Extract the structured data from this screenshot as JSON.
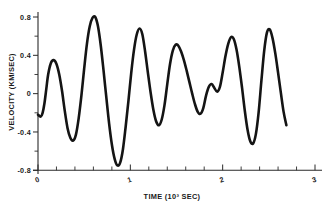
{
  "chart_data": {
    "type": "line",
    "title": "",
    "subtitle": "",
    "xlabel": "TIME (10³ SEC)",
    "ylabel": "VELOCITY (KM/SEC)",
    "xlim": [
      0,
      3.1
    ],
    "ylim": [
      -0.8,
      0.8
    ],
    "grid": false,
    "legend": "none",
    "xticks": [
      0,
      1,
      2,
      3
    ],
    "xtick_labels": [
      "0",
      "1",
      "2",
      "3"
    ],
    "xticks_minor": [
      0.2,
      0.4,
      0.6,
      0.8,
      1.2,
      1.4,
      1.6,
      1.8,
      2.2,
      2.4,
      2.6,
      2.8
    ],
    "yticks": [
      0.8,
      0.4,
      0,
      -0.4,
      -0.8
    ],
    "ytick_labels": [
      "0.8",
      "0.4",
      "0",
      "-0.4",
      "-0.8"
    ],
    "yticks_minor": [
      0.6,
      0.2,
      -0.2,
      -0.6
    ],
    "series": [
      {
        "name": "velocity",
        "color": "#141414",
        "x": [
          0.0,
          0.03,
          0.05,
          0.07,
          0.09,
          0.11,
          0.14,
          0.17,
          0.2,
          0.23,
          0.26,
          0.29,
          0.32,
          0.35,
          0.38,
          0.41,
          0.44,
          0.47,
          0.5,
          0.53,
          0.56,
          0.59,
          0.62,
          0.65,
          0.68,
          0.71,
          0.74,
          0.77,
          0.8,
          0.83,
          0.86,
          0.89,
          0.92,
          0.95,
          0.98,
          1.01,
          1.04,
          1.07,
          1.1,
          1.13,
          1.16,
          1.19,
          1.22,
          1.25,
          1.28,
          1.31,
          1.34,
          1.37,
          1.4,
          1.43,
          1.46,
          1.49,
          1.52,
          1.55,
          1.58,
          1.61,
          1.64,
          1.67,
          1.7,
          1.73,
          1.76,
          1.79,
          1.82,
          1.85,
          1.88,
          1.91,
          1.94,
          1.97,
          2.0,
          2.03,
          2.06,
          2.09,
          2.12,
          2.15,
          2.18,
          2.21,
          2.24,
          2.27,
          2.3,
          2.33,
          2.36,
          2.39,
          2.42,
          2.45,
          2.48,
          2.51,
          2.54,
          2.57,
          2.6,
          2.63,
          2.66,
          2.69
        ],
        "y": [
          -0.22,
          -0.24,
          -0.2,
          -0.1,
          0.05,
          0.2,
          0.32,
          0.35,
          0.31,
          0.2,
          0.03,
          -0.18,
          -0.36,
          -0.46,
          -0.49,
          -0.43,
          -0.26,
          -0.02,
          0.26,
          0.52,
          0.7,
          0.79,
          0.8,
          0.7,
          0.5,
          0.24,
          -0.04,
          -0.31,
          -0.53,
          -0.68,
          -0.75,
          -0.72,
          -0.58,
          -0.34,
          -0.07,
          0.22,
          0.46,
          0.62,
          0.68,
          0.62,
          0.44,
          0.22,
          0.01,
          -0.17,
          -0.29,
          -0.33,
          -0.27,
          -0.12,
          0.1,
          0.31,
          0.45,
          0.51,
          0.5,
          0.44,
          0.35,
          0.24,
          0.12,
          0.0,
          -0.11,
          -0.19,
          -0.21,
          -0.15,
          -0.02,
          0.07,
          0.1,
          0.06,
          0.02,
          0.07,
          0.22,
          0.39,
          0.52,
          0.59,
          0.57,
          0.46,
          0.28,
          0.06,
          -0.18,
          -0.38,
          -0.5,
          -0.52,
          -0.42,
          -0.19,
          0.14,
          0.45,
          0.64,
          0.67,
          0.58,
          0.42,
          0.22,
          0.01,
          -0.19,
          -0.33
        ]
      }
    ]
  },
  "axes": {
    "y_axis_title": "VELOCITY (KM/SEC)",
    "x_axis_title": "TIME (10³ SEC)",
    "y_tick_labels": [
      "0.8",
      "0.4",
      "0",
      "-0.4",
      "-0.8"
    ],
    "x_tick_labels": [
      "0",
      "1",
      "2",
      "3"
    ]
  },
  "colors": {
    "trace": "#141414",
    "axis": "#2a2a2a",
    "background": "#ffffff",
    "text": "#1a1a1a"
  }
}
